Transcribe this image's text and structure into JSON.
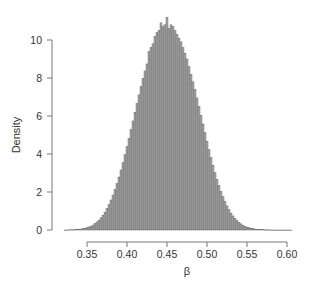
{
  "chart_data": {
    "type": "bar",
    "subtype": "histogram",
    "title": "",
    "xlabel": "β",
    "ylabel": "Density",
    "xlim": [
      0.32,
      0.61
    ],
    "ylim": [
      0,
      11.5
    ],
    "x_ticks": [
      0.35,
      0.4,
      0.45,
      0.5,
      0.55,
      0.6
    ],
    "x_tick_labels": [
      "0.35",
      "0.40",
      "0.45",
      "0.50",
      "0.55",
      "0.60"
    ],
    "y_ticks": [
      0,
      2,
      4,
      6,
      8,
      10
    ],
    "y_tick_labels": [
      "0",
      "2",
      "4",
      "6",
      "8",
      "10"
    ],
    "grid": false,
    "legend": null,
    "bar_color": "#a8a8a8",
    "bar_edge_color": "#555555",
    "bin_width": 0.0025,
    "distribution_summary": {
      "approx_mean": 0.472,
      "approx_sd": 0.0356,
      "peak_density": 11.2
    },
    "bins": {
      "x": [
        0.3225,
        0.325,
        0.3275,
        0.33,
        0.3325,
        0.335,
        0.3375,
        0.34,
        0.3425,
        0.345,
        0.3475,
        0.35,
        0.3525,
        0.355,
        0.3575,
        0.36,
        0.3625,
        0.365,
        0.3675,
        0.37,
        0.3725,
        0.375,
        0.3775,
        0.38,
        0.3825,
        0.385,
        0.3875,
        0.39,
        0.3925,
        0.395,
        0.3975,
        0.4,
        0.4025,
        0.405,
        0.4075,
        0.41,
        0.4125,
        0.415,
        0.4175,
        0.42,
        0.4225,
        0.425,
        0.4275,
        0.43,
        0.4325,
        0.435,
        0.4375,
        0.44,
        0.4425,
        0.445,
        0.4475,
        0.45,
        0.4525,
        0.455,
        0.4575,
        0.46,
        0.4625,
        0.465,
        0.4675,
        0.47,
        0.4725,
        0.475,
        0.4775,
        0.48,
        0.4825,
        0.485,
        0.4875,
        0.49,
        0.4925,
        0.495,
        0.4975,
        0.5,
        0.5025,
        0.505,
        0.5075,
        0.51,
        0.5125,
        0.515,
        0.5175,
        0.52,
        0.5225,
        0.525,
        0.5275,
        0.53,
        0.5325,
        0.535,
        0.5375,
        0.54,
        0.5425,
        0.545,
        0.5475,
        0.55,
        0.5525,
        0.555,
        0.5575,
        0.56,
        0.5625,
        0.565,
        0.5675,
        0.57,
        0.5725,
        0.575,
        0.5775,
        0.58,
        0.5825,
        0.585,
        0.5875,
        0.59,
        0.5925,
        0.595,
        0.5975,
        0.6,
        0.6025,
        0.605
      ],
      "density": [
        0.0,
        0.0,
        0.01,
        0.01,
        0.01,
        0.02,
        0.03,
        0.04,
        0.05,
        0.07,
        0.09,
        0.12,
        0.16,
        0.2,
        0.26,
        0.33,
        0.42,
        0.52,
        0.64,
        0.78,
        0.94,
        1.13,
        1.34,
        1.58,
        1.84,
        2.13,
        2.45,
        2.79,
        3.16,
        3.55,
        3.96,
        4.39,
        4.83,
        5.28,
        5.74,
        6.2,
        6.66,
        7.11,
        7.55,
        7.97,
        8.37,
        8.74,
        9.4,
        9.6,
        9.8,
        10.2,
        10.4,
        10.5,
        10.9,
        10.7,
        10.8,
        11.2,
        10.6,
        10.8,
        10.7,
        10.5,
        10.3,
        10.1,
        9.9,
        9.6,
        9.3,
        9.0,
        8.6,
        8.2,
        7.8,
        7.4,
        6.95,
        6.5,
        6.04,
        5.58,
        5.12,
        4.67,
        4.23,
        3.81,
        3.41,
        3.03,
        2.67,
        2.34,
        2.03,
        1.75,
        1.5,
        1.27,
        1.07,
        0.89,
        0.74,
        0.61,
        0.49,
        0.4,
        0.32,
        0.25,
        0.2,
        0.15,
        0.12,
        0.09,
        0.07,
        0.05,
        0.04,
        0.03,
        0.02,
        0.02,
        0.01,
        0.01,
        0.01,
        0.0,
        0.0,
        0.0,
        0.0,
        0.0,
        0.0,
        0.0,
        0.0,
        0.0,
        0.0,
        0.0,
        0.0
      ]
    }
  }
}
